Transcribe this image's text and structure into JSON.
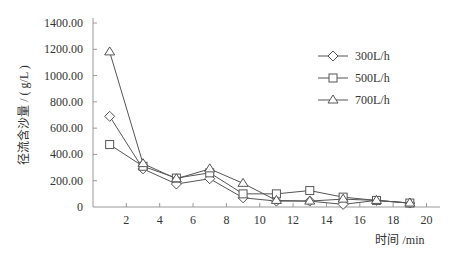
{
  "chart_data": {
    "type": "line",
    "title": "",
    "xlabel": "时间 /min",
    "ylabel": "径流含沙量 / ( g/L )",
    "xlim": [
      0,
      20
    ],
    "ylim": [
      0,
      1400
    ],
    "x_ticks": [
      2,
      4,
      6,
      8,
      10,
      12,
      14,
      16,
      18,
      20
    ],
    "y_ticks": [
      "0",
      "200.00",
      "400.00",
      "600.00",
      "800.00",
      "1000.00",
      "1200.00",
      "1400.00"
    ],
    "grid": false,
    "legend_position": "upper right",
    "x": [
      1,
      3,
      5,
      7,
      9,
      11,
      13,
      15,
      17,
      19
    ],
    "series": [
      {
        "name": "300L/h",
        "marker": "diamond",
        "values": [
          690,
          290,
          175,
          215,
          70,
          45,
          45,
          20,
          50,
          30
        ]
      },
      {
        "name": "500L/h",
        "marker": "square",
        "values": [
          475,
          310,
          220,
          260,
          100,
          100,
          125,
          75,
          50,
          30
        ]
      },
      {
        "name": "700L/h",
        "marker": "triangle",
        "values": [
          1180,
          330,
          215,
          290,
          180,
          50,
          45,
          60,
          50,
          30
        ]
      }
    ]
  },
  "style": {
    "line_color": "#555555",
    "axis_color": "#999999"
  }
}
